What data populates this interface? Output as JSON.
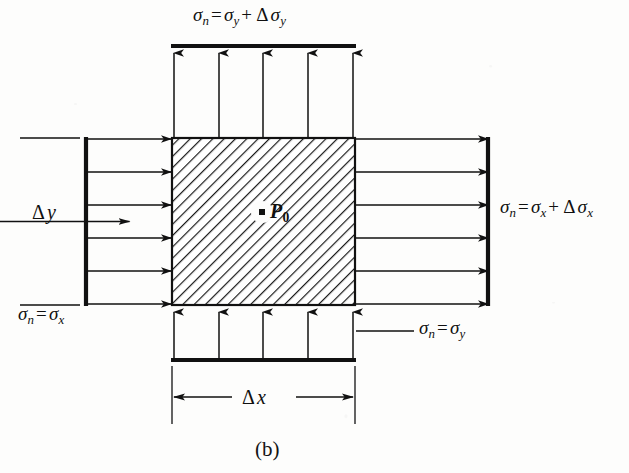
{
  "figure": {
    "caption": "(b)",
    "center_point_label": "P",
    "center_point_subscript": "0",
    "element_shape": "square-hatched"
  },
  "labels": {
    "top": {
      "sigma": "σ",
      "sub_n": "n",
      "equals": "=",
      "sigma2": "σ",
      "sub2": "y",
      "plus": "+",
      "delta": "Δ",
      "sigma3": "σ",
      "sub3": "y",
      "full_text": "σn = σy + Δσy"
    },
    "right": {
      "sigma": "σ",
      "sub_n": "n",
      "equals": "=",
      "sigma2": "σ",
      "sub2": "x",
      "plus": "+",
      "delta": "Δ",
      "sigma3": "σ",
      "sub3": "x",
      "full_text": "σn = σx + Δσx"
    },
    "left": {
      "sigma": "σ",
      "sub_n": "n",
      "equals": "=",
      "sigma2": "σ",
      "sub2": "x",
      "full_text": "σn = σx"
    },
    "bottom": {
      "sigma": "σ",
      "sub_n": "n",
      "equals": "=",
      "sigma2": "σ",
      "sub2": "y",
      "full_text": "σn = σy"
    },
    "dim_y": {
      "delta": "Δ",
      "var": "y",
      "full_text": "Δy"
    },
    "dim_x": {
      "delta": "Δ",
      "var": "x",
      "full_text": "Δx"
    }
  },
  "colors": {
    "ink": "#111111",
    "paper": "#fdfdfc",
    "hatch": "#1a1a1a"
  },
  "geometry": {
    "element": {
      "x": 172,
      "y": 138,
      "width": 183,
      "height": 167
    },
    "top_bar_y": 46,
    "bottom_bar_y": 360,
    "left_bar_x": 86,
    "right_bar_x": 488,
    "arrows_top_count": 5,
    "arrows_bottom_count": 5,
    "arrows_left_count": 6,
    "arrows_right_count": 6,
    "hatch_angle_deg": 45
  }
}
